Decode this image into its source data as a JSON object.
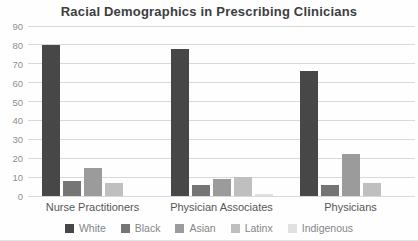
{
  "title": "Racial Demographics in Prescribing Clinicians",
  "colors": {
    "grid": "#d9d9d9",
    "title_text": "#3d3d3d",
    "tick_text": "#8f8f8f",
    "category_text": "#565656",
    "legend_text": "#858585"
  },
  "chart_data": {
    "type": "bar",
    "title": "Racial Demographics in Prescribing Clinicians",
    "categories": [
      "Nurse Practitioners",
      "Physician Associates",
      "Physicians"
    ],
    "series": [
      {
        "name": "White",
        "color": "#474747",
        "values": [
          80,
          78,
          66
        ]
      },
      {
        "name": "Black",
        "color": "#757575",
        "values": [
          8,
          6,
          6
        ]
      },
      {
        "name": "Asian",
        "color": "#9b9b9b",
        "values": [
          15,
          9,
          22
        ]
      },
      {
        "name": "Latinx",
        "color": "#bfbfbf",
        "values": [
          7,
          10,
          7
        ]
      },
      {
        "name": "Indigenous",
        "color": "#e1e1e1",
        "values": [
          0,
          1,
          0
        ]
      }
    ],
    "xlabel": "",
    "ylabel": "",
    "ylim": [
      0,
      90
    ],
    "yticks": [
      0,
      10,
      20,
      30,
      40,
      50,
      60,
      70,
      80,
      90
    ],
    "grid": true,
    "legend_position": "bottom"
  }
}
